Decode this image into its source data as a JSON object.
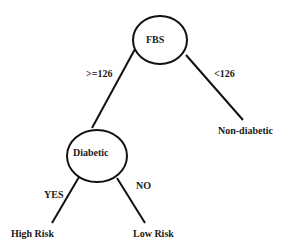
{
  "diagram": {
    "type": "decision-tree",
    "nodes": {
      "root": {
        "label": "FBS"
      },
      "diabetic": {
        "label": "Diabetic"
      }
    },
    "leaves": {
      "non_diabetic": {
        "label": "Non-diabetic"
      },
      "high_risk": {
        "label": "High Risk"
      },
      "low_risk": {
        "label": "Low Risk"
      }
    },
    "edges": {
      "fbs_high": {
        "label": ">=126",
        "from": "FBS",
        "to": "Diabetic"
      },
      "fbs_low": {
        "label": "<126",
        "from": "FBS",
        "to": "Non-diabetic"
      },
      "diabetic_yes": {
        "label": "YES",
        "from": "Diabetic",
        "to": "High Risk"
      },
      "diabetic_no": {
        "label": "NO",
        "from": "Diabetic",
        "to": "Low Risk"
      }
    },
    "colors": {
      "stroke": "#111111",
      "text": "#1a1a1a",
      "background": "#ffffff"
    }
  }
}
